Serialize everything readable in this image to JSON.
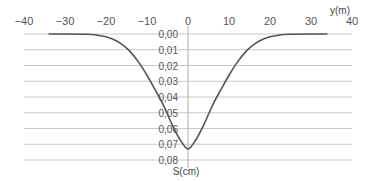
{
  "chart_data": {
    "type": "line",
    "title": "",
    "xlabel": "y(m)",
    "ylabel": "S(cm)",
    "xlim": [
      -40,
      40
    ],
    "ylim": [
      0,
      0.08
    ],
    "y_inverted": true,
    "grid": "horizontal",
    "x_ticks": [
      -40,
      -30,
      -20,
      -10,
      0,
      10,
      20,
      30,
      40
    ],
    "x_tick_labels": [
      "−40",
      "−30",
      "−20",
      "−10",
      "0",
      "10",
      "20",
      "30",
      "40"
    ],
    "y_ticks": [
      0.0,
      0.01,
      0.02,
      0.03,
      0.04,
      0.05,
      0.06,
      0.07,
      0.08
    ],
    "y_tick_labels": [
      "0,00",
      "0,01",
      "0,02",
      "0,03",
      "0,04",
      "0,05",
      "0,06",
      "0,07",
      "0,08"
    ],
    "series": [
      {
        "name": "S",
        "color": "#555555",
        "x": [
          -34,
          -30,
          -25,
          -22,
          -20,
          -18,
          -16,
          -14,
          -12,
          -10,
          -8,
          -6,
          -4,
          -2,
          0,
          2,
          4,
          6,
          8,
          10,
          12,
          14,
          16,
          18,
          20,
          22,
          25,
          30,
          34
        ],
        "y": [
          0.0,
          0.0,
          0.0002,
          0.0008,
          0.0018,
          0.0036,
          0.0068,
          0.0115,
          0.018,
          0.0262,
          0.0355,
          0.0451,
          0.0568,
          0.0668,
          0.073,
          0.0668,
          0.0568,
          0.0451,
          0.0355,
          0.0262,
          0.018,
          0.0115,
          0.0068,
          0.0036,
          0.0018,
          0.0008,
          0.0002,
          0.0,
          0.0
        ]
      }
    ]
  },
  "colors": {
    "grid": "#c8c8c8",
    "axis": "#b0b0b0",
    "curve": "#555555"
  }
}
